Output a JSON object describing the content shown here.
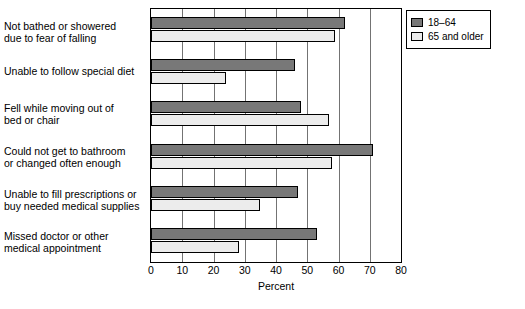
{
  "chart_data": {
    "type": "bar",
    "orientation": "horizontal",
    "title": "",
    "xlabel": "Percent",
    "ylabel": "",
    "xlim": [
      0,
      80
    ],
    "xticks": [
      0,
      10,
      20,
      30,
      40,
      50,
      60,
      70,
      80
    ],
    "grid": true,
    "legend_position": "top-right",
    "categories": [
      "Not bathed or showered\ndue to fear of falling",
      "Unable to follow special diet",
      "Fell while moving out of\nbed or chair",
      "Could not get to bathroom\nor changed often enough",
      "Unable to fill prescriptions or\nbuy needed medical supplies",
      "Missed doctor or other\nmedical appointment"
    ],
    "series": [
      {
        "name": "18–64",
        "color": "#787878",
        "values": [
          62,
          46,
          48,
          71,
          47,
          53
        ]
      },
      {
        "name": "65 and older",
        "color": "#ececec",
        "values": [
          59,
          24,
          57,
          58,
          35,
          28
        ]
      }
    ]
  },
  "legend": {
    "items": [
      {
        "label": "18–64"
      },
      {
        "label": "65 and older"
      }
    ]
  },
  "axis": {
    "x_label": "Percent",
    "ticks": [
      "0",
      "10",
      "20",
      "30",
      "40",
      "50",
      "60",
      "70",
      "80"
    ]
  },
  "categories": [
    {
      "line1": "Not bathed or showered",
      "line2": "due to fear of falling"
    },
    {
      "line1": "Unable to follow special diet",
      "line2": ""
    },
    {
      "line1": "Fell while moving out of",
      "line2": "bed or chair"
    },
    {
      "line1": "Could not get to bathroom",
      "line2": "or changed often enough"
    },
    {
      "line1": "Unable to fill prescriptions or",
      "line2": "buy needed medical supplies"
    },
    {
      "line1": "Missed doctor or other",
      "line2": "medical appointment"
    }
  ]
}
